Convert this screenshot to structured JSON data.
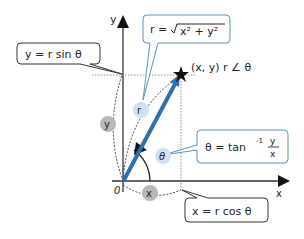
{
  "diagram": {
    "axes": {
      "x_label": "x",
      "y_label": "y",
      "origin_label": "0"
    },
    "point_label": "(x, y)  r ∠ θ",
    "callouts": {
      "y_eq": "y = r sin θ",
      "r_eq_prefix": "r = ",
      "r_eq_radicand": "x² + y²",
      "theta_eq_prefix": "θ = tan",
      "theta_eq_sup": "-1",
      "theta_frac_num": "y",
      "theta_frac_den": "x",
      "x_eq": "x = r cos θ"
    },
    "badges": {
      "r": "r",
      "theta": "θ",
      "y": "y",
      "x": "x"
    },
    "colors": {
      "vector": "#2f6fae",
      "badge_blue": "#cfe0f0",
      "badge_gray": "#b8b8b8",
      "callout_blue_border": "#5a8fc0",
      "callout_dark_border": "#333333"
    }
  }
}
